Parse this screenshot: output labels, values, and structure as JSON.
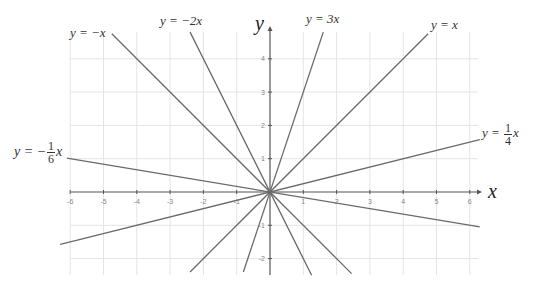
{
  "chart_data": {
    "type": "line",
    "title": "",
    "xlabel": "x",
    "ylabel": "y",
    "xlim": [
      -6.2,
      6.3
    ],
    "ylim": [
      -2.5,
      4.6
    ],
    "grid": true,
    "x_ticks": [
      -6,
      -5,
      -4,
      -3,
      -2,
      -1,
      1,
      2,
      3,
      4,
      5,
      6
    ],
    "y_ticks": [
      -2,
      -1,
      1,
      2,
      3,
      4
    ],
    "series": [
      {
        "name": "y = -x",
        "slope": -1,
        "x": [
          -4.75,
          2.45
        ],
        "y": [
          4.75,
          -2.45
        ]
      },
      {
        "name": "y = -2x",
        "slope": -2,
        "x": [
          -2.4,
          1.25
        ],
        "y": [
          4.8,
          -2.5
        ]
      },
      {
        "name": "y = 3x",
        "slope": 3,
        "x": [
          -0.8,
          1.6
        ],
        "y": [
          -2.4,
          4.8
        ]
      },
      {
        "name": "y = x",
        "slope": 1,
        "x": [
          -2.4,
          4.75
        ],
        "y": [
          -2.4,
          4.75
        ]
      },
      {
        "name": "y = 1/4 x",
        "slope": 0.25,
        "x": [
          -6.3,
          6.3
        ],
        "y": [
          -1.575,
          1.575
        ]
      },
      {
        "name": "y = -1/6 x",
        "slope": -0.1667,
        "x": [
          -6.1,
          6.3
        ],
        "y": [
          1.017,
          -1.05
        ]
      }
    ]
  },
  "labels": {
    "neg_x": {
      "lhs": "y = −x"
    },
    "neg_2x": {
      "lhs": "y = −2x"
    },
    "three_x": {
      "lhs": "y = 3x"
    },
    "x": {
      "lhs": "y = x"
    },
    "quarter_x": {
      "lhs": "y = ",
      "num": "1",
      "den": "4",
      "rhs": "x"
    },
    "neg_sixth_x": {
      "lhs": "y = −",
      "num": "1",
      "den": "6",
      "rhs": "x"
    }
  },
  "axes": {
    "x_name": "x",
    "y_name": "y"
  },
  "plot": {
    "origin_px": [
      270,
      192
    ],
    "unit_px": 33.3,
    "x_range_px": [
      63,
      478
    ],
    "y_range_px": [
      32,
      275
    ],
    "grid_color": "#e4e4e4",
    "axis_color": "#555555",
    "line_color": "#6a6a6a",
    "tick_label_color": "#888888"
  }
}
